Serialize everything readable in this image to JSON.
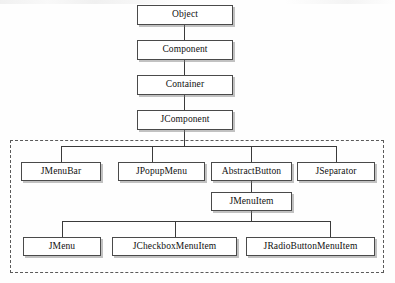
{
  "diagram": {
    "nodes": {
      "object": "Object",
      "component": "Component",
      "container": "Container",
      "jcomponent": "JComponent",
      "jmenubar": "JMenuBar",
      "jpopupmenu": "JPopupMenu",
      "abstractbutton": "AbstractButton",
      "jseparator": "JSeparator",
      "jmenuitem": "JMenuItem",
      "jmenu": "JMenu",
      "jcheckboxmenuitem": "JCheckboxMenuItem",
      "jradiobuttonmenuitem": "JRadioButtonMenuItem"
    },
    "colors": {
      "box_fill": "#ffffff",
      "box_border": "#4a4a4a",
      "box_shadow": "#787878",
      "connector": "#3a3a3a",
      "group_border": "#5a5a5a",
      "text": "#101010",
      "background": "#fefefe"
    },
    "group_region_label": "swing-menu-classes"
  }
}
